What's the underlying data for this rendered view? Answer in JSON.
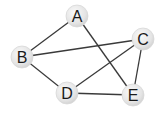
{
  "graph": {
    "nodes": [
      {
        "id": "A",
        "label": "A",
        "x": 77,
        "y": 16
      },
      {
        "id": "B",
        "label": "B",
        "x": 22,
        "y": 57
      },
      {
        "id": "C",
        "label": "C",
        "x": 143,
        "y": 39
      },
      {
        "id": "D",
        "label": "D",
        "x": 67,
        "y": 93
      },
      {
        "id": "E",
        "label": "E",
        "x": 133,
        "y": 95
      }
    ],
    "edges": [
      {
        "from": "A",
        "to": "B"
      },
      {
        "from": "A",
        "to": "E"
      },
      {
        "from": "B",
        "to": "C"
      },
      {
        "from": "B",
        "to": "D"
      },
      {
        "from": "C",
        "to": "D"
      },
      {
        "from": "C",
        "to": "E"
      },
      {
        "from": "D",
        "to": "E"
      }
    ],
    "colors": {
      "edge": "#3a3a3a",
      "node_fill": "#e6e6e6",
      "node_highlight": "#f7f7f7",
      "node_shadow": "#c4c4c4",
      "label": "#1a1a1a"
    }
  }
}
